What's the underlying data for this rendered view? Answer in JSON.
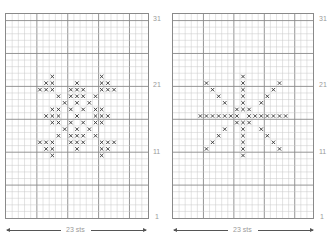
{
  "charts": [
    {
      "id": "left",
      "columns": 23,
      "rows": 31,
      "row_labels": [
        "31",
        "21",
        "11",
        "1"
      ],
      "width_label": "23 sts",
      "stitch_symbol": "x",
      "stitches": [
        [
          9,
          [
            7,
            15
          ]
        ],
        [
          10,
          [
            6,
            7,
            11,
            15,
            16
          ]
        ],
        [
          11,
          [
            5,
            6,
            7,
            10,
            11,
            12,
            15,
            16,
            17
          ]
        ],
        [
          12,
          [
            8,
            10,
            11,
            12,
            14
          ]
        ],
        [
          13,
          [
            9,
            11,
            13
          ]
        ],
        [
          14,
          [
            7,
            8,
            10,
            12,
            14,
            15
          ]
        ],
        [
          15,
          [
            6,
            7,
            8,
            11,
            14,
            15,
            16
          ]
        ],
        [
          16,
          [
            7,
            8,
            10,
            12,
            14,
            15
          ]
        ],
        [
          17,
          [
            9,
            11,
            13
          ]
        ],
        [
          18,
          [
            8,
            10,
            11,
            12,
            14
          ]
        ],
        [
          19,
          [
            5,
            6,
            7,
            10,
            11,
            12,
            15,
            16,
            17
          ]
        ],
        [
          20,
          [
            6,
            7,
            11,
            15,
            16
          ]
        ],
        [
          21,
          [
            7,
            15
          ]
        ]
      ]
    },
    {
      "id": "right",
      "columns": 23,
      "rows": 31,
      "row_labels": [
        "31",
        "21",
        "11",
        "1"
      ],
      "width_label": "23 sts",
      "stitch_symbol": "x",
      "stitches": [
        [
          9,
          [
            11
          ]
        ],
        [
          10,
          [
            5,
            11,
            17
          ]
        ],
        [
          11,
          [
            6,
            11,
            16
          ]
        ],
        [
          12,
          [
            7,
            11,
            15
          ]
        ],
        [
          13,
          [
            8,
            11,
            14
          ]
        ],
        [
          14,
          [
            10,
            11,
            12
          ]
        ],
        [
          15,
          [
            4,
            5,
            6,
            7,
            8,
            9,
            10,
            12,
            13,
            14,
            15,
            16,
            17,
            18
          ]
        ],
        [
          16,
          [
            10,
            11,
            12
          ]
        ],
        [
          17,
          [
            8,
            11,
            14
          ]
        ],
        [
          18,
          [
            7,
            11,
            15
          ]
        ],
        [
          19,
          [
            6,
            11,
            16
          ]
        ],
        [
          20,
          [
            5,
            11,
            17
          ]
        ],
        [
          21,
          [
            11
          ]
        ]
      ]
    }
  ],
  "colors": {
    "grid_minor": "#c8c8c8",
    "grid_major": "#8a8a8a",
    "stitch": "#333333",
    "label": "#9a9a9a"
  }
}
